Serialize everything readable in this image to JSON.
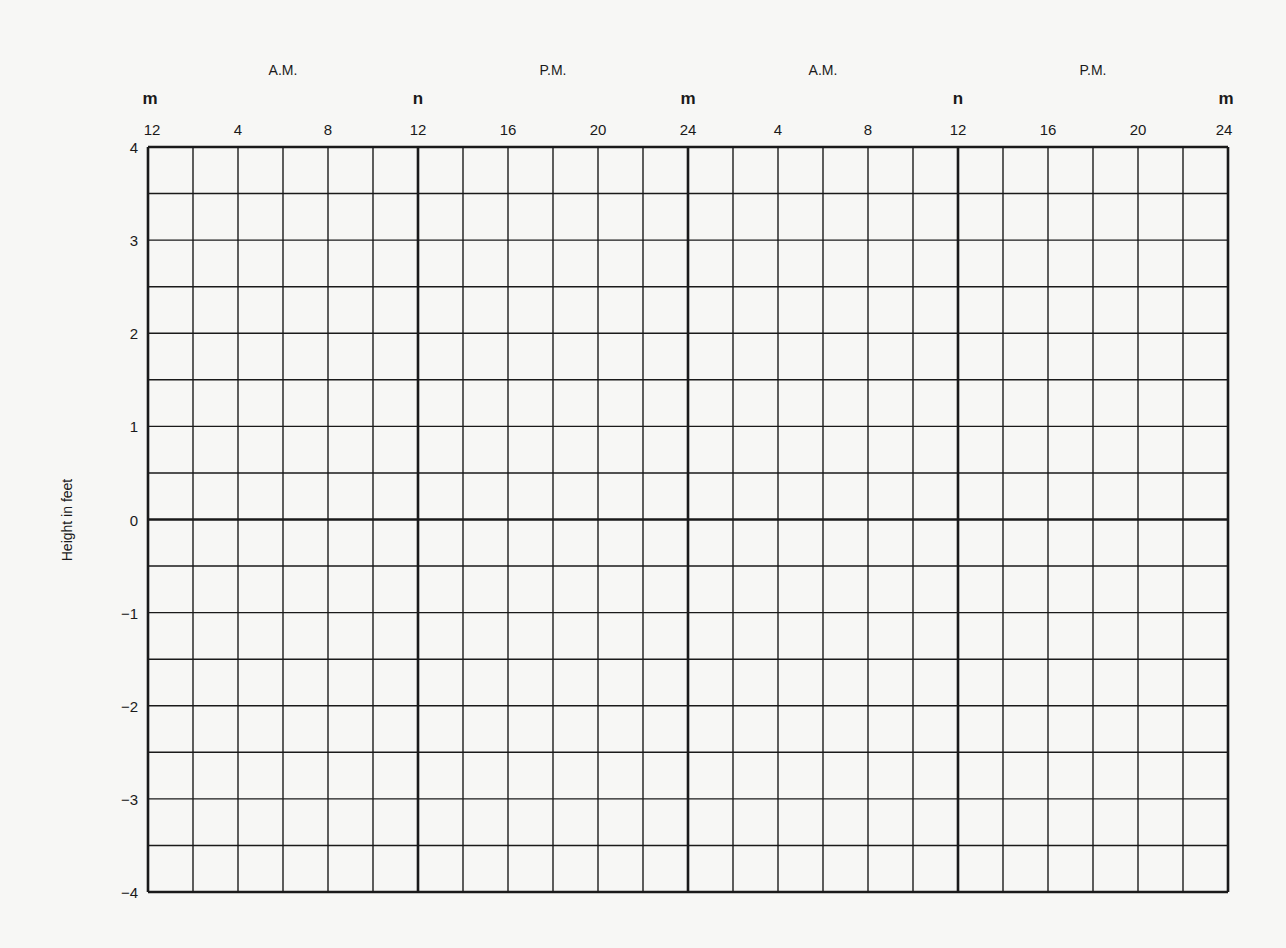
{
  "chart_data": {
    "type": "line",
    "title": "",
    "xlabel": "",
    "ylabel": "Height in feet",
    "xlim": [
      0,
      48
    ],
    "ylim": [
      -4,
      4
    ],
    "grid": true,
    "x_grid_step_hours": 2,
    "y_grid_step_feet": 0.5,
    "period_labels": [
      {
        "text": "A.M.",
        "x": 6
      },
      {
        "text": "P.M.",
        "x": 18
      },
      {
        "text": "A.M.",
        "x": 30
      },
      {
        "text": "P.M.",
        "x": 42
      }
    ],
    "marker_labels": [
      {
        "text": "m",
        "x": 0
      },
      {
        "text": "n",
        "x": 12
      },
      {
        "text": "m",
        "x": 24
      },
      {
        "text": "n",
        "x": 36
      },
      {
        "text": "m",
        "x": 48
      }
    ],
    "x_ticks": [
      {
        "text": "12",
        "x": 0
      },
      {
        "text": "4",
        "x": 4
      },
      {
        "text": "8",
        "x": 8
      },
      {
        "text": "12",
        "x": 12
      },
      {
        "text": "16",
        "x": 16
      },
      {
        "text": "20",
        "x": 20
      },
      {
        "text": "24",
        "x": 24
      },
      {
        "text": "4",
        "x": 28
      },
      {
        "text": "8",
        "x": 32
      },
      {
        "text": "12",
        "x": 36
      },
      {
        "text": "16",
        "x": 40
      },
      {
        "text": "20",
        "x": 44
      },
      {
        "text": "24",
        "x": 48
      }
    ],
    "y_ticks": [
      {
        "text": "4",
        "y": 4
      },
      {
        "text": "3",
        "y": 3
      },
      {
        "text": "2",
        "y": 2
      },
      {
        "text": "1",
        "y": 1
      },
      {
        "text": "0",
        "y": 0
      },
      {
        "text": "−1",
        "y": -1
      },
      {
        "text": "−2",
        "y": -2
      },
      {
        "text": "−3",
        "y": -3
      },
      {
        "text": "−4",
        "y": -4
      }
    ],
    "emphasized_x": [
      0,
      12,
      24,
      36,
      48
    ],
    "emphasized_y": [
      0
    ],
    "series": []
  },
  "colors": {
    "background": "#f7f7f5",
    "grid_line": "#1a1a1a",
    "text": "#1a1a1a"
  }
}
